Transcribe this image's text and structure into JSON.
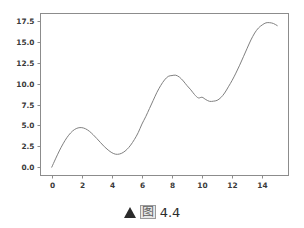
{
  "figure": {
    "background_color": "#ffffff",
    "caption": {
      "marker_icon": "filled-triangle-icon",
      "cjk_label": "图",
      "number": "4.4"
    }
  },
  "chart_data": {
    "type": "line",
    "title": "",
    "xlabel": "",
    "ylabel": "",
    "xlim": [
      -0.75,
      15.75
    ],
    "ylim": [
      -1.0,
      18.4
    ],
    "xticks": [
      0,
      2,
      4,
      6,
      8,
      10,
      12,
      14
    ],
    "xtick_labels": [
      "0",
      "2",
      "4",
      "6",
      "8",
      "10",
      "12",
      "14"
    ],
    "yticks": [
      0.0,
      2.5,
      5.0,
      7.5,
      10.0,
      12.5,
      15.0,
      17.5
    ],
    "ytick_labels": [
      "0.0",
      "2.5",
      "5.0",
      "7.5",
      "10.0",
      "12.5",
      "15.0",
      "17.5"
    ],
    "grid": false,
    "legend": null,
    "line_color": "#808080",
    "line_width": 1.0,
    "spine_color": "#8c8c8c",
    "series": [
      {
        "name": "curve",
        "x": [
          0.0,
          0.25,
          0.5,
          0.75,
          1.0,
          1.25,
          1.5,
          1.75,
          2.0,
          2.25,
          2.5,
          2.75,
          3.0,
          3.25,
          3.5,
          3.75,
          4.0,
          4.25,
          4.5,
          4.75,
          5.0,
          5.25,
          5.5,
          5.75,
          6.0,
          6.25,
          6.5,
          6.75,
          7.0,
          7.25,
          7.5,
          7.75,
          8.0,
          8.25,
          8.5,
          8.75,
          9.0,
          9.25,
          9.5,
          9.75,
          10.0,
          10.25,
          10.5,
          10.75,
          11.0,
          11.25,
          11.5,
          11.75,
          12.0,
          12.25,
          12.5,
          12.75,
          13.0,
          13.25,
          13.5,
          13.75,
          14.0,
          14.25,
          14.5,
          14.75,
          15.0
        ],
        "y": [
          0.0,
          0.99,
          1.94,
          2.79,
          3.52,
          4.09,
          4.49,
          4.7,
          4.73,
          4.59,
          4.3,
          3.89,
          3.42,
          2.93,
          2.45,
          2.05,
          1.73,
          1.55,
          1.57,
          1.76,
          2.12,
          2.64,
          3.32,
          4.13,
          5.16,
          6.04,
          7.02,
          8.0,
          8.97,
          9.78,
          10.44,
          10.87,
          10.97,
          11.01,
          10.77,
          10.32,
          9.76,
          9.26,
          8.69,
          8.29,
          8.37,
          8.09,
          7.88,
          7.9,
          8.0,
          8.33,
          8.88,
          9.62,
          10.39,
          11.26,
          12.21,
          13.22,
          14.24,
          15.23,
          16.06,
          16.66,
          17.03,
          17.28,
          17.3,
          17.2,
          16.95
        ]
      }
    ]
  }
}
